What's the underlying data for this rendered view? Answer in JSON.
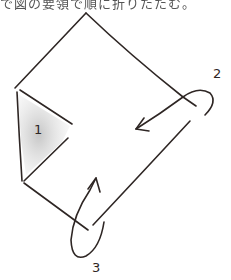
{
  "caption": {
    "text": "で図の要領で順に折りたたむ。"
  },
  "diagram": {
    "type": "folding-instruction-sketch",
    "stroke_color": "#2e2624",
    "shade_color": "#c8c8c8",
    "steps": [
      {
        "number": "1",
        "label": "1"
      },
      {
        "number": "2",
        "label": "2"
      },
      {
        "number": "3",
        "label": "3"
      }
    ]
  }
}
